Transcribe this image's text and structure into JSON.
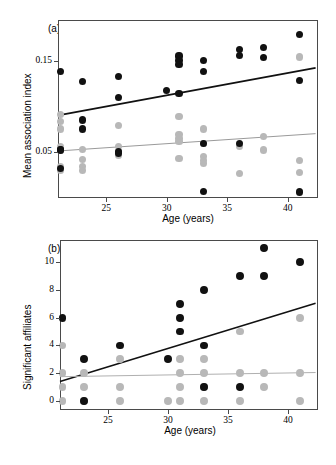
{
  "figure": {
    "panels": [
      {
        "letter": "(a)",
        "xlabel": "Age (years)",
        "ylabel": "Mean association index",
        "xticks": [
          "25",
          "30",
          "35",
          "40"
        ],
        "yticks": [
          "0.15",
          "0.05"
        ]
      },
      {
        "letter": "(b)",
        "xlabel": "Age (years)",
        "ylabel": "Significant affiliates",
        "xticks": [
          "25",
          "30",
          "35",
          "40"
        ],
        "yticks": [
          "10",
          "8",
          "6",
          "4",
          "2",
          "0"
        ]
      }
    ],
    "colors": {
      "black_series": "#111111",
      "grey_series": "#b8b8b8",
      "axis": "#4a4a4a"
    }
  },
  "chart_data": [
    {
      "type": "scatter",
      "panel": "(a)",
      "title": "",
      "xlabel": "Age (years)",
      "ylabel": "Mean association index",
      "xlim": [
        21,
        42.5
      ],
      "ylim": [
        0.0,
        0.195
      ],
      "xticks": [
        25,
        30,
        35,
        40
      ],
      "yticks": [
        0.05,
        0.15
      ],
      "grid": false,
      "legend": null,
      "series": [
        {
          "name": "black",
          "color": "#111111",
          "marker": "filled-circle",
          "points": [
            [
              21.2,
              0.1385
            ],
            [
              21.2,
              0.0535
            ],
            [
              21.2,
              0.0525
            ],
            [
              21.2,
              0.0325
            ],
            [
              23.0,
              0.1275
            ],
            [
              23.0,
              0.0855
            ],
            [
              23.0,
              0.0755
            ],
            [
              26.0,
              0.1335
            ],
            [
              26.0,
              0.1105
            ],
            [
              26.0,
              0.0505
            ],
            [
              26.0,
              0.0485
            ],
            [
              30.0,
              0.1175
            ],
            [
              31.0,
              0.1555
            ],
            [
              31.0,
              0.1505
            ],
            [
              31.0,
              0.1465
            ],
            [
              31.0,
              0.1145
            ],
            [
              33.0,
              0.1505
            ],
            [
              33.0,
              0.1385
            ],
            [
              33.0,
              0.0595
            ],
            [
              33.0,
              0.0075
            ],
            [
              36.0,
              0.1625
            ],
            [
              36.0,
              0.1565
            ],
            [
              36.0,
              0.0595
            ],
            [
              38.0,
              0.1645
            ],
            [
              38.0,
              0.1535
            ],
            [
              41.0,
              0.1795
            ],
            [
              41.0,
              0.1285
            ],
            [
              41.0,
              0.0065
            ]
          ]
        },
        {
          "name": "grey",
          "color": "#b8b8b8",
          "marker": "filled-circle",
          "points": [
            [
              21.2,
              0.0915
            ],
            [
              21.2,
              0.0835
            ],
            [
              21.2,
              0.0755
            ],
            [
              21.2,
              0.0565
            ],
            [
              21.2,
              0.0525
            ],
            [
              21.2,
              0.0345
            ],
            [
              21.2,
              0.0305
            ],
            [
              23.0,
              0.0535
            ],
            [
              23.0,
              0.0425
            ],
            [
              23.0,
              0.0345
            ],
            [
              23.0,
              0.0305
            ],
            [
              26.0,
              0.0795
            ],
            [
              26.0,
              0.0565
            ],
            [
              26.0,
              0.0505
            ],
            [
              26.0,
              0.0465
            ],
            [
              31.0,
              0.0895
            ],
            [
              31.0,
              0.0695
            ],
            [
              31.0,
              0.0655
            ],
            [
              31.0,
              0.0615
            ],
            [
              31.0,
              0.0435
            ],
            [
              33.0,
              0.0755
            ],
            [
              33.0,
              0.0595
            ],
            [
              33.0,
              0.0455
            ],
            [
              33.0,
              0.0415
            ],
            [
              33.0,
              0.0375
            ],
            [
              36.0,
              0.0565
            ],
            [
              36.0,
              0.0265
            ],
            [
              38.0,
              0.0675
            ],
            [
              38.0,
              0.0525
            ],
            [
              41.0,
              0.1545
            ],
            [
              41.0,
              0.0415
            ],
            [
              41.0,
              0.0275
            ]
          ]
        }
      ],
      "trendlines": [
        {
          "name": "black-fit",
          "color": "#111111",
          "width": 1.8,
          "x0": 21.0,
          "y0": 0.0905,
          "x1": 42.3,
          "y1": 0.1425
        },
        {
          "name": "grey-fit",
          "color": "#9a9a9a",
          "width": 1.0,
          "x0": 21.0,
          "y0": 0.0515,
          "x1": 42.3,
          "y1": 0.0705
        }
      ]
    },
    {
      "type": "scatter",
      "panel": "(b)",
      "title": "",
      "xlabel": "Age (years)",
      "ylabel": "Significant affiliates",
      "xlim": [
        21,
        42.5
      ],
      "ylim": [
        -0.65,
        11.6
      ],
      "xticks": [
        25,
        30,
        35,
        40
      ],
      "yticks": [
        0,
        2,
        4,
        6,
        8,
        10
      ],
      "grid": false,
      "legend": null,
      "series": [
        {
          "name": "black",
          "color": "#111111",
          "marker": "filled-circle",
          "points": [
            [
              21.2,
              6
            ],
            [
              23.0,
              3
            ],
            [
              23.0,
              0
            ],
            [
              26.0,
              4
            ],
            [
              30.0,
              3
            ],
            [
              31.0,
              7
            ],
            [
              31.0,
              6
            ],
            [
              31.0,
              5
            ],
            [
              33.0,
              8
            ],
            [
              33.0,
              4
            ],
            [
              33.0,
              1
            ],
            [
              36.0,
              9
            ],
            [
              36.0,
              1
            ],
            [
              38.0,
              11
            ],
            [
              38.0,
              9
            ],
            [
              41.0,
              10
            ]
          ]
        },
        {
          "name": "grey",
          "color": "#b8b8b8",
          "marker": "filled-circle",
          "points": [
            [
              21.2,
              4
            ],
            [
              21.2,
              2
            ],
            [
              21.2,
              1
            ],
            [
              21.2,
              0
            ],
            [
              23.0,
              2
            ],
            [
              23.0,
              1
            ],
            [
              23.0,
              0
            ],
            [
              26.0,
              3
            ],
            [
              26.0,
              1
            ],
            [
              26.0,
              0
            ],
            [
              30.0,
              0
            ],
            [
              31.0,
              3
            ],
            [
              31.0,
              2
            ],
            [
              31.0,
              1
            ],
            [
              31.0,
              0
            ],
            [
              33.0,
              3
            ],
            [
              33.0,
              2
            ],
            [
              33.0,
              1
            ],
            [
              33.0,
              0
            ],
            [
              36.0,
              5
            ],
            [
              36.0,
              2
            ],
            [
              36.0,
              0
            ],
            [
              38.0,
              2
            ],
            [
              38.0,
              1
            ],
            [
              41.0,
              6
            ],
            [
              41.0,
              2
            ],
            [
              41.0,
              0
            ]
          ]
        }
      ],
      "trendlines": [
        {
          "name": "black-fit",
          "color": "#111111",
          "width": 1.6,
          "x0": 21.0,
          "y0": 1.4,
          "x1": 42.3,
          "y1": 7.05
        },
        {
          "name": "grey-fit",
          "color": "#b0b0b0",
          "width": 1.0,
          "x0": 21.0,
          "y0": 1.75,
          "x1": 42.3,
          "y1": 2.05
        }
      ]
    }
  ]
}
